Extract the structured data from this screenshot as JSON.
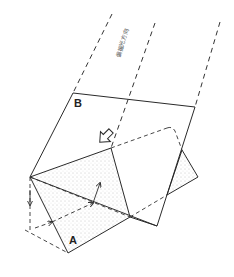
{
  "diagram": {
    "labels": {
      "face_b": "B",
      "face_a": "A",
      "direction_text": "偏振光方向"
    },
    "colors": {
      "line": "#2a2a2a",
      "dash": "#333333",
      "stipple": "#9a9a9a",
      "background": "#ffffff"
    },
    "elements": {
      "parallel_rays": 3,
      "face_b_rectangle": true,
      "prism_face_a": "stippled triangular prism",
      "light_path_arrows": 3,
      "hollow_arrow": "pointing down-right"
    }
  }
}
